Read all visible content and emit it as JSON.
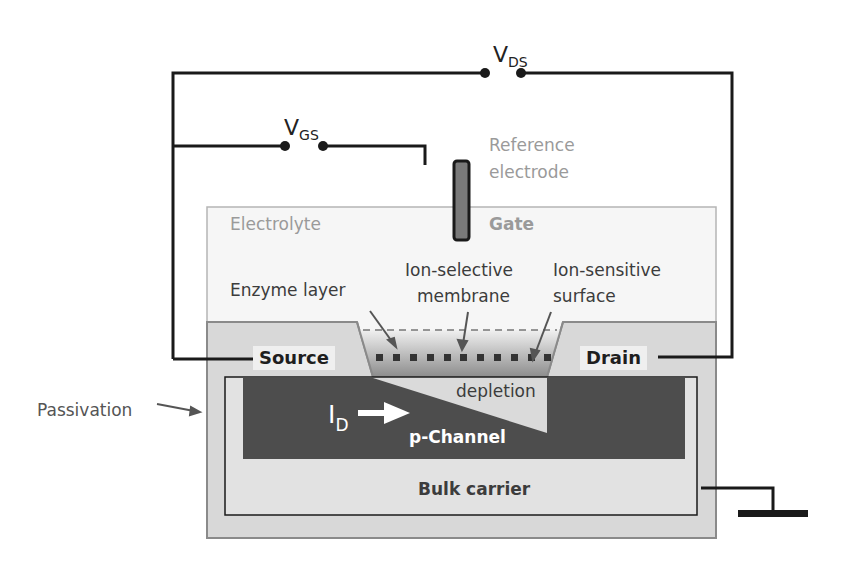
{
  "diagram": {
    "voltages": {
      "vds": {
        "main": "V",
        "sub": "DS"
      },
      "vgs": {
        "main": "V",
        "sub": "GS"
      }
    },
    "labels": {
      "reference_electrode_line1": "Reference",
      "reference_electrode_line2": "electrode",
      "electrolyte": "Electrolyte",
      "gate": "Gate",
      "ion_selective_line1": "Ion-selective",
      "ion_selective_line2": "membrane",
      "ion_sensitive_line1": "Ion-sensitive",
      "ion_sensitive_line2": "surface",
      "enzyme_layer": "Enzyme layer",
      "source": "Source",
      "drain": "Drain",
      "depletion": "depletion",
      "current_main": "I",
      "current_sub": "D",
      "p_channel": "p-Channel",
      "bulk_carrier": "Bulk carrier",
      "passivation": "Passivation"
    },
    "colors": {
      "wire": "#1a1a1a",
      "electrolyte_fill": "#f5f5f5",
      "passivation_fill": "#d9d9d9",
      "channel_fill": "#4d4d4d",
      "bulk_fill": "#e2e2e2",
      "electrode_fill": "#7a7a7a",
      "membrane_dot": "#333333",
      "grey_text": "#9a9a9a"
    }
  }
}
